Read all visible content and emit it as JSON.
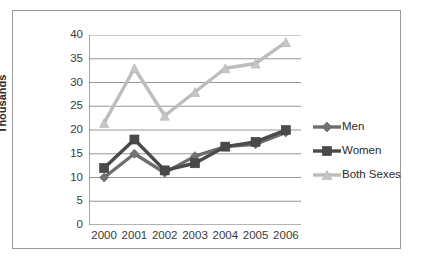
{
  "chart_data": {
    "type": "line",
    "title": "",
    "subtitle": "",
    "xlabel": "",
    "ylabel": "Thousands",
    "categories": [
      "2000",
      "2001",
      "2002",
      "2003",
      "2004",
      "2005",
      "2006"
    ],
    "x": [
      2000,
      2001,
      2002,
      2003,
      2004,
      2005,
      2006
    ],
    "ylim": [
      0,
      40
    ],
    "yticks": [
      0,
      5,
      10,
      15,
      20,
      25,
      30,
      35,
      40
    ],
    "ytick_labels": [
      "0",
      "5",
      "10",
      "15",
      "20",
      "25",
      "30",
      "35",
      "40"
    ],
    "grid": "horizontal",
    "legend_position": "right",
    "series": [
      {
        "name": "Men",
        "marker": "diamond",
        "color": "#6e6e6e",
        "values": [
          10,
          15,
          11,
          14.5,
          16.5,
          17,
          19.5
        ]
      },
      {
        "name": "Women",
        "marker": "square",
        "color": "#4a4a4a",
        "values": [
          12,
          18,
          11.5,
          13,
          16.5,
          17.5,
          20
        ]
      },
      {
        "name": "Both Sexes",
        "marker": "triangle",
        "color": "#bdbdbd",
        "values": [
          21.5,
          33,
          23,
          28,
          33,
          34,
          38.5
        ]
      }
    ]
  },
  "axis": {
    "y_title": "Thousands",
    "y_tick_labels": [
      "40",
      "35",
      "30",
      "25",
      "20",
      "15",
      "10",
      "5",
      "0"
    ],
    "x_tick_labels": [
      "2000",
      "2001",
      "2002",
      "2003",
      "2004",
      "2005",
      "2006"
    ]
  },
  "legend": {
    "items": [
      {
        "label": "Men",
        "icon": "diamond-marker-icon"
      },
      {
        "label": "Women",
        "icon": "square-marker-icon"
      },
      {
        "label": "Both Sexes",
        "icon": "triangle-marker-icon"
      }
    ]
  },
  "colors": {
    "men": "#6e6e6e",
    "women": "#4a4a4a",
    "both_sexes": "#bdbdbd",
    "gridline": "#8c8c8c",
    "axis": "#6b6b6b",
    "frame": "#9a9a9a",
    "text": "#3a3a3a"
  }
}
